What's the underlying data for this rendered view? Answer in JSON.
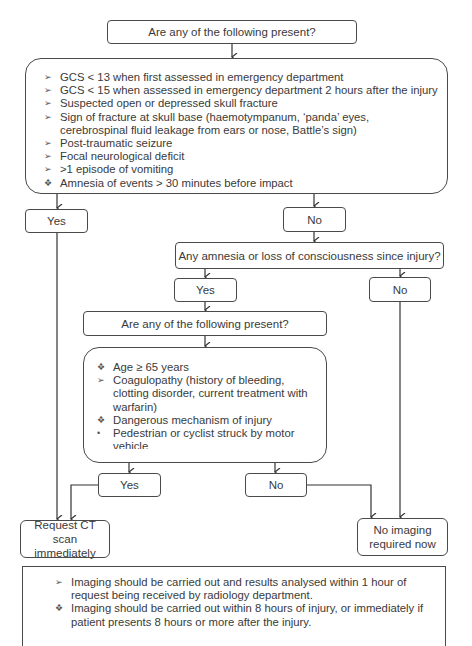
{
  "flowchart": {
    "q1": {
      "label": "Are any of the following present?"
    },
    "criteria1": {
      "items": [
        {
          "bullet": "arrow",
          "glyph": "➢",
          "text": "GCS < 13 when first assessed in emergency department"
        },
        {
          "bullet": "arrow",
          "glyph": "➢",
          "text": "GCS < 15 when assessed in emergency department 2 hours after the injury"
        },
        {
          "bullet": "arrow",
          "glyph": "➢",
          "text": "Suspected open or depressed skull fracture"
        },
        {
          "bullet": "arrow",
          "glyph": "➢",
          "text": "Sign of fracture at skull base (haemotympanum, ‘panda’ eyes, cerebrospinal fluid leakage from ears or nose, Battle’s sign)"
        },
        {
          "bullet": "arrow",
          "glyph": "➢",
          "text": "Post-traumatic seizure"
        },
        {
          "bullet": "arrow",
          "glyph": "➢",
          "text": "Focal neurological deficit"
        },
        {
          "bullet": "arrow",
          "glyph": "➢",
          "text": ">1 episode of vomiting"
        },
        {
          "bullet": "diamond",
          "glyph": "❖",
          "text": "Amnesia of events > 30 minutes before impact"
        }
      ]
    },
    "yes1": {
      "label": "Yes"
    },
    "no1": {
      "label": "No"
    },
    "q2": {
      "label": "Any amnesia or loss of consciousness since injury?"
    },
    "yes2": {
      "label": "Yes"
    },
    "no2": {
      "label": "No"
    },
    "q3": {
      "label": "Are any of the following present?"
    },
    "criteria2": {
      "items": [
        {
          "bullet": "diamond",
          "glyph": "❖",
          "text": "Age ≥ 65 years"
        },
        {
          "bullet": "arrow",
          "glyph": "➢",
          "text": "Coagulopathy (history of bleeding, clotting disorder, current treatment with warfarin)"
        },
        {
          "bullet": "diamond",
          "glyph": "❖",
          "text": "Dangerous mechanism of injury"
        },
        {
          "bullet": "dot",
          "glyph": "•",
          "text": "Pedestrian or cyclist struck by motor vehicle"
        },
        {
          "bullet": "dot",
          "glyph": "•",
          "text": "Occupant ejected from a motor vehicle"
        },
        {
          "bullet": "dot",
          "glyph": "•",
          "text": "Fall from > 1 m or 5 stairs"
        }
      ]
    },
    "yes3": {
      "label": "Yes"
    },
    "no3": {
      "label": "No"
    },
    "outcome_ct": {
      "label": "Request CT scan immediately"
    },
    "outcome_none": {
      "label": "No imaging required now"
    },
    "notes": {
      "items": [
        {
          "bullet": "arrow",
          "glyph": "➢",
          "text": "Imaging should be carried out and results analysed within 1 hour of request being received by radiology department."
        },
        {
          "bullet": "diamond",
          "glyph": "❖",
          "text": "Imaging should be carried out within 8 hours of injury, or immediately if patient presents 8 hours or more after the injury."
        }
      ]
    }
  }
}
